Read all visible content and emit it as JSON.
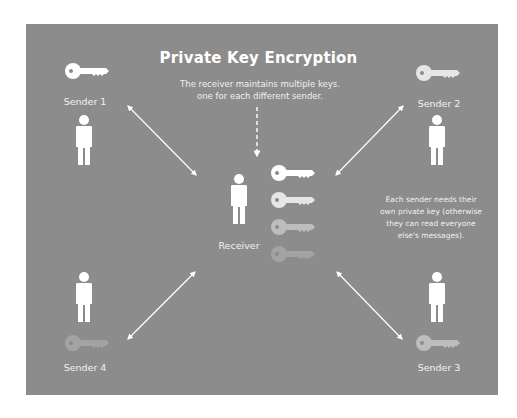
{
  "diagram": {
    "title": "Private Key Encryption",
    "subtitle_line1": "The receiver maintains multiple keys.",
    "subtitle_line2": "one for each different sender.",
    "note_lines": [
      "Each sender needs their",
      "own private key (otherwise",
      "they can read everyone",
      "else's messages)."
    ],
    "receiver": {
      "label": "Receiver",
      "key_count": 4
    },
    "senders": [
      {
        "label": "Sender 1",
        "key_color": "#ffffff"
      },
      {
        "label": "Sender 2",
        "key_color": "#e6e6e6"
      },
      {
        "label": "Sender 3",
        "key_color": "#bdbdbd"
      },
      {
        "label": "Sender 4",
        "key_color": "#a3a3a3"
      }
    ],
    "colors": {
      "background": "#8c8c8c",
      "foreground": "#ffffff",
      "receiver_keys": [
        "#ffffff",
        "#e6e6e6",
        "#bdbdbd",
        "#a3a3a3"
      ]
    }
  }
}
